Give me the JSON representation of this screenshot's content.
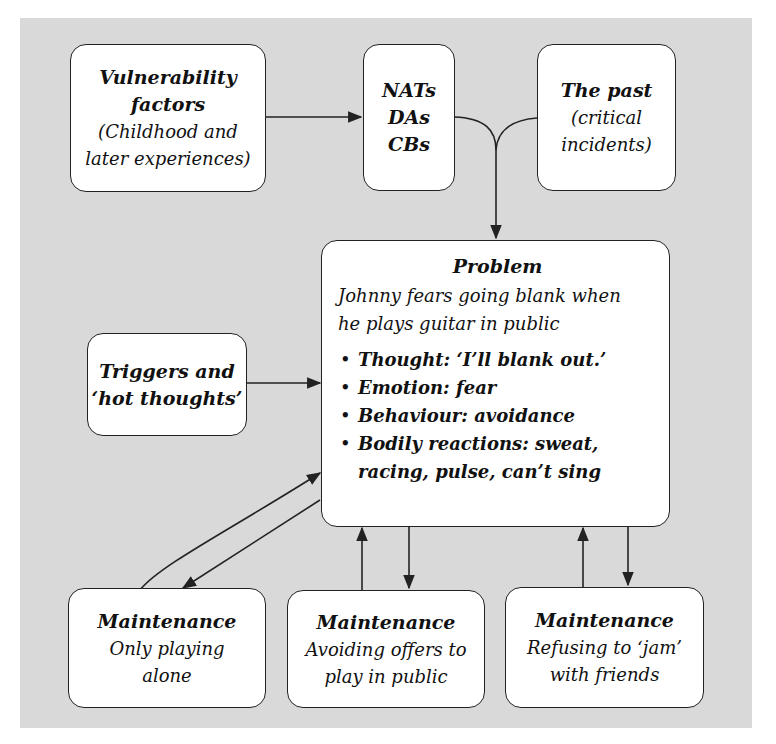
{
  "diagram": {
    "background_color": "#d9d9d9",
    "box_color": "#ffffff",
    "line_color": "#222222",
    "vulnerability": {
      "title": "Vulnerability factors",
      "title_lines": [
        "Vulnerability",
        "factors"
      ],
      "lines": [
        "(Childhood and",
        "later experiences)"
      ]
    },
    "cognitions": {
      "lines": [
        "NATs",
        "DAs",
        "CBs"
      ]
    },
    "past": {
      "title": "The past",
      "lines": [
        "(critical",
        "incidents)"
      ]
    },
    "triggers": {
      "lines": [
        "Triggers and",
        "‘hot thoughts’"
      ]
    },
    "problem": {
      "title": "Problem",
      "description_lines": [
        "Johnny fears going blank when",
        "he plays guitar in public"
      ],
      "bullets": [
        {
          "key": "Thought:",
          "value": " ‘I’ll blank out.’"
        },
        {
          "key": "Emotion:",
          "value": " fear"
        },
        {
          "key": "Behaviour:",
          "value": " avoidance"
        },
        {
          "key": "Bodily reactions:",
          "value": " sweat, racing, pulse, can’t sing"
        }
      ]
    },
    "maintenance": [
      {
        "title": "Maintenance",
        "lines": [
          "Only playing",
          "alone"
        ]
      },
      {
        "title": "Maintenance",
        "lines": [
          "Avoiding offers to",
          "play in public"
        ]
      },
      {
        "title": "Maintenance",
        "lines": [
          "Refusing to ‘jam’",
          "with friends"
        ]
      }
    ],
    "edges": [
      {
        "from": "vulnerability",
        "to": "cognitions"
      },
      {
        "from": "cognitions",
        "to": "problem"
      },
      {
        "from": "past",
        "to": "problem"
      },
      {
        "from": "triggers",
        "to": "problem"
      },
      {
        "from": "maintenance-1",
        "to": "problem",
        "bidirectional": true
      },
      {
        "from": "maintenance-2",
        "to": "problem",
        "bidirectional": true
      },
      {
        "from": "maintenance-3",
        "to": "problem",
        "bidirectional": true
      }
    ]
  }
}
